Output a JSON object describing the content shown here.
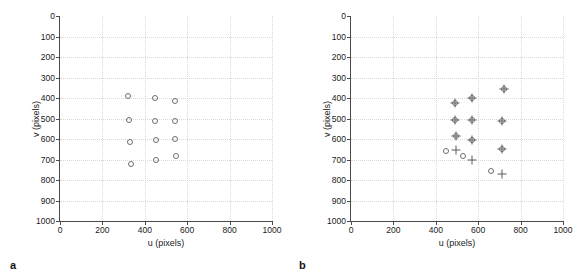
{
  "figure": {
    "panels": [
      {
        "letter": "a",
        "name": "panel-a",
        "xlabel": "u (pixels)",
        "ylabel": "v (pixels)",
        "xticks": [
          0,
          200,
          400,
          600,
          800,
          1000
        ],
        "yticks": [
          0,
          100,
          200,
          300,
          400,
          500,
          600,
          700,
          800,
          900,
          1000
        ]
      },
      {
        "letter": "b",
        "name": "panel-b",
        "xlabel": "u (pixels)",
        "ylabel": "v (pixels)",
        "xticks": [
          0,
          200,
          400,
          600,
          800,
          1000
        ],
        "yticks": [
          0,
          100,
          200,
          300,
          400,
          500,
          600,
          700,
          800,
          900,
          1000
        ]
      }
    ]
  },
  "chart_data": [
    {
      "type": "scatter",
      "panel": "a",
      "title": "",
      "xlabel": "u (pixels)",
      "ylabel": "v (pixels)",
      "xlim": [
        0,
        1000
      ],
      "ylim": [
        0,
        1000
      ],
      "y_inverted": true,
      "grid": true,
      "legend": null,
      "series": [
        {
          "name": "detected points",
          "marker": "circle",
          "color": "#6e6e6e",
          "points": [
            {
              "u": 322,
              "v": 388
            },
            {
              "u": 448,
              "v": 402
            },
            {
              "u": 543,
              "v": 413
            },
            {
              "u": 327,
              "v": 508
            },
            {
              "u": 450,
              "v": 510
            },
            {
              "u": 541,
              "v": 511
            },
            {
              "u": 330,
              "v": 617
            },
            {
              "u": 452,
              "v": 607
            },
            {
              "u": 543,
              "v": 598
            },
            {
              "u": 335,
              "v": 722
            },
            {
              "u": 455,
              "v": 700
            },
            {
              "u": 545,
              "v": 684
            }
          ]
        }
      ]
    },
    {
      "type": "scatter",
      "panel": "b",
      "title": "",
      "xlabel": "u (pixels)",
      "ylabel": "v (pixels)",
      "xlim": [
        0,
        1000
      ],
      "ylim": [
        0,
        1000
      ],
      "y_inverted": true,
      "grid": true,
      "legend": null,
      "series": [
        {
          "name": "measured points",
          "marker": "circle",
          "color": "#6e6e6e",
          "points": [
            {
              "u": 492,
              "v": 425
            },
            {
              "u": 572,
              "v": 400
            },
            {
              "u": 722,
              "v": 355
            },
            {
              "u": 492,
              "v": 507
            },
            {
              "u": 572,
              "v": 508
            },
            {
              "u": 712,
              "v": 510
            },
            {
              "u": 497,
              "v": 585
            },
            {
              "u": 572,
              "v": 607
            },
            {
              "u": 712,
              "v": 648
            },
            {
              "u": 450,
              "v": 660
            },
            {
              "u": 530,
              "v": 683
            },
            {
              "u": 660,
              "v": 755
            }
          ]
        },
        {
          "name": "projected points",
          "marker": "plus",
          "color": "#5a5a5a",
          "points": [
            {
              "u": 492,
              "v": 425
            },
            {
              "u": 572,
              "v": 400
            },
            {
              "u": 722,
              "v": 355
            },
            {
              "u": 492,
              "v": 507
            },
            {
              "u": 572,
              "v": 508
            },
            {
              "u": 712,
              "v": 510
            },
            {
              "u": 497,
              "v": 585
            },
            {
              "u": 572,
              "v": 607
            },
            {
              "u": 712,
              "v": 648
            },
            {
              "u": 497,
              "v": 655
            },
            {
              "u": 570,
              "v": 700
            },
            {
              "u": 712,
              "v": 770
            }
          ]
        }
      ]
    }
  ]
}
